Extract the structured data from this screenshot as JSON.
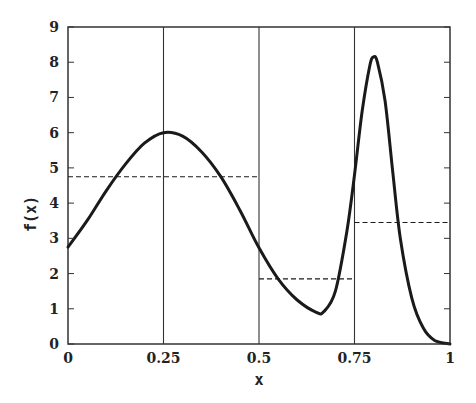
{
  "chart_data": {
    "type": "line",
    "title": "",
    "xlabel": "x",
    "ylabel": "f(x)",
    "xlim": [
      0,
      1
    ],
    "ylim": [
      0,
      9
    ],
    "grid": false,
    "legend": null,
    "x_ticks": [
      0,
      0.25,
      0.5,
      0.75,
      1
    ],
    "x_tick_labels": [
      "0",
      "0.25",
      "0.5",
      "0.75",
      "1"
    ],
    "y_ticks": [
      0,
      1,
      2,
      3,
      4,
      5,
      6,
      7,
      8,
      9
    ],
    "y_tick_labels": [
      "0",
      "1",
      "2",
      "3",
      "4",
      "5",
      "6",
      "7",
      "8",
      "9"
    ],
    "vertical_lines": [
      0.25,
      0.5,
      0.75
    ],
    "series": [
      {
        "name": "f(x)",
        "style": "solid",
        "x": [
          0,
          0.05,
          0.1,
          0.15,
          0.2,
          0.25,
          0.3,
          0.35,
          0.4,
          0.45,
          0.5,
          0.55,
          0.6,
          0.65,
          0.67,
          0.7,
          0.73,
          0.75,
          0.77,
          0.79,
          0.8,
          0.81,
          0.83,
          0.85,
          0.87,
          0.9,
          0.93,
          0.96,
          1.0
        ],
        "y": [
          2.75,
          3.5,
          4.35,
          5.1,
          5.7,
          6.0,
          5.9,
          5.45,
          4.75,
          3.8,
          2.73,
          1.85,
          1.25,
          0.9,
          0.92,
          1.5,
          3.2,
          4.8,
          6.6,
          7.9,
          8.15,
          8.0,
          6.9,
          4.9,
          3.0,
          1.3,
          0.45,
          0.1,
          0.0
        ]
      },
      {
        "name": "piecewise mean",
        "style": "dashed",
        "segments": [
          {
            "x0": 0,
            "x1": 0.5,
            "y": 4.75
          },
          {
            "x0": 0.5,
            "x1": 0.75,
            "y": 1.85
          },
          {
            "x0": 0.75,
            "x1": 1.0,
            "y": 3.45
          }
        ]
      }
    ]
  },
  "colors": {
    "line": "#1a1a1a",
    "axis": "#333333",
    "background": "#ffffff"
  }
}
